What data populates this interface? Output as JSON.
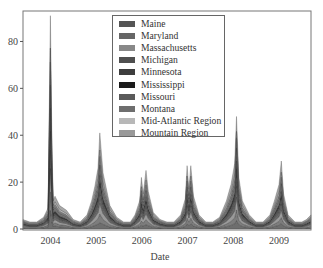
{
  "chart_data": {
    "type": "area",
    "stacked": true,
    "title": "",
    "xlabel": "Date",
    "ylabel": "",
    "xlim": [
      2003.4,
      2009.7
    ],
    "ylim": [
      0,
      93
    ],
    "grid": false,
    "legend_position": "upper center",
    "x_ticks": [
      "2004",
      "2005",
      "2006",
      "2007",
      "2008",
      "2009"
    ],
    "y_ticks": [
      0,
      20,
      40,
      60,
      80
    ],
    "x": [
      2003.4,
      2003.55,
      2003.7,
      2003.85,
      2003.95,
      2004.0,
      2004.03,
      2004.06,
      2004.1,
      2004.2,
      2004.35,
      2004.5,
      2004.65,
      2004.8,
      2004.9,
      2004.97,
      2005.04,
      2005.08,
      2005.15,
      2005.3,
      2005.45,
      2005.6,
      2005.75,
      2005.85,
      2005.95,
      2005.99,
      2006.03,
      2006.09,
      2006.14,
      2006.25,
      2006.4,
      2006.55,
      2006.7,
      2006.85,
      2006.95,
      2006.99,
      2007.03,
      2007.07,
      2007.13,
      2007.25,
      2007.4,
      2007.55,
      2007.7,
      2007.85,
      2007.95,
      2008.03,
      2008.07,
      2008.12,
      2008.2,
      2008.35,
      2008.5,
      2008.65,
      2008.8,
      2008.9,
      2009.0,
      2009.05,
      2009.1,
      2009.2,
      2009.35,
      2009.5,
      2009.6,
      2009.7
    ],
    "series": [
      {
        "name": "Maine",
        "color": "#555555",
        "values": [
          0.4,
          0.3,
          0.3,
          0.5,
          0.9,
          4,
          7,
          3,
          1.4,
          1.0,
          0.8,
          0.4,
          0.3,
          0.5,
          0.9,
          1.4,
          1.8,
          3,
          1.2,
          0.8,
          0.5,
          0.3,
          0.3,
          0.6,
          0.9,
          1.1,
          0.9,
          1.2,
          1.0,
          0.7,
          0.4,
          0.3,
          0.3,
          0.6,
          1.0,
          1.4,
          1.0,
          1.4,
          1.0,
          0.6,
          0.3,
          0.3,
          0.5,
          0.9,
          1.3,
          2,
          4,
          1.6,
          1.0,
          0.6,
          0.3,
          0.3,
          0.6,
          1.0,
          1.3,
          2.2,
          1.1,
          0.6,
          0.3,
          0.3,
          0.4,
          0.5
        ]
      },
      {
        "name": "Maryland",
        "color": "#666666",
        "values": [
          0.4,
          0.3,
          0.3,
          0.5,
          0.9,
          4,
          8,
          3,
          1.4,
          1.0,
          0.8,
          0.4,
          0.3,
          0.6,
          1.0,
          1.5,
          2,
          4,
          1.3,
          0.9,
          0.5,
          0.3,
          0.3,
          0.6,
          1.0,
          1.3,
          1.0,
          1.4,
          1.0,
          0.7,
          0.4,
          0.3,
          0.3,
          0.6,
          1.1,
          1.5,
          1.1,
          1.5,
          1.0,
          0.6,
          0.3,
          0.3,
          0.5,
          1.0,
          1.4,
          2.2,
          5,
          1.8,
          1.0,
          0.6,
          0.3,
          0.3,
          0.6,
          1.0,
          1.4,
          2.4,
          1.2,
          0.6,
          0.3,
          0.3,
          0.4,
          0.5
        ]
      },
      {
        "name": "Massachusetts",
        "color": "#888888",
        "values": [
          0.5,
          0.4,
          0.4,
          0.6,
          1.0,
          5,
          9,
          4,
          1.6,
          1.2,
          0.9,
          0.5,
          0.4,
          0.7,
          1.2,
          1.8,
          2.4,
          5,
          1.6,
          1.0,
          0.6,
          0.4,
          0.4,
          0.7,
          1.2,
          1.6,
          1.2,
          1.7,
          1.2,
          0.8,
          0.5,
          0.4,
          0.4,
          0.7,
          1.3,
          1.8,
          1.3,
          1.8,
          1.2,
          0.7,
          0.4,
          0.4,
          0.6,
          1.2,
          1.7,
          2.6,
          6,
          2.2,
          1.2,
          0.7,
          0.4,
          0.4,
          0.7,
          1.2,
          1.7,
          3,
          1.4,
          0.7,
          0.4,
          0.4,
          0.5,
          0.6
        ]
      },
      {
        "name": "Michigan",
        "color": "#4f4f4f",
        "values": [
          0.4,
          0.3,
          0.3,
          0.5,
          0.9,
          4,
          8,
          3,
          1.4,
          1.0,
          0.8,
          0.4,
          0.3,
          0.6,
          1.0,
          1.5,
          2,
          4,
          1.3,
          0.9,
          0.5,
          0.3,
          0.3,
          0.6,
          1.0,
          1.4,
          1.0,
          1.5,
          1.0,
          0.7,
          0.4,
          0.3,
          0.3,
          0.6,
          1.1,
          1.5,
          1.1,
          1.5,
          1.0,
          0.6,
          0.3,
          0.3,
          0.5,
          1.0,
          1.4,
          2.2,
          5,
          1.8,
          1.0,
          0.6,
          0.3,
          0.3,
          0.6,
          1.0,
          1.4,
          2.4,
          1.2,
          0.6,
          0.3,
          0.3,
          0.4,
          0.5
        ]
      },
      {
        "name": "Minnesota",
        "color": "#3d3d3d",
        "values": [
          0.3,
          0.2,
          0.2,
          0.4,
          0.8,
          4,
          8,
          3,
          1.2,
          0.9,
          0.7,
          0.3,
          0.2,
          0.5,
          0.9,
          1.4,
          1.9,
          4,
          1.2,
          0.8,
          0.4,
          0.2,
          0.2,
          0.5,
          0.9,
          1.3,
          0.9,
          1.4,
          0.9,
          0.6,
          0.3,
          0.2,
          0.2,
          0.5,
          1.0,
          1.4,
          1.0,
          1.4,
          0.9,
          0.5,
          0.2,
          0.2,
          0.4,
          0.9,
          1.3,
          2.1,
          5,
          1.7,
          0.9,
          0.5,
          0.2,
          0.2,
          0.5,
          0.9,
          1.3,
          2.3,
          1.1,
          0.5,
          0.2,
          0.2,
          0.3,
          0.4
        ]
      },
      {
        "name": "Mississippi",
        "color": "#1a1a1a",
        "values": [
          0.4,
          0.3,
          0.3,
          0.5,
          1.0,
          5,
          10,
          4,
          1.5,
          1.1,
          0.8,
          0.4,
          0.3,
          0.6,
          1.1,
          1.7,
          2.4,
          5,
          1.5,
          1.0,
          0.5,
          0.3,
          0.3,
          0.6,
          1.1,
          1.6,
          1.1,
          1.6,
          1.1,
          0.7,
          0.4,
          0.3,
          0.3,
          0.6,
          1.2,
          1.7,
          1.2,
          1.7,
          1.1,
          0.6,
          0.3,
          0.3,
          0.5,
          1.1,
          1.6,
          2.5,
          7,
          2.0,
          1.1,
          0.6,
          0.3,
          0.3,
          0.6,
          1.1,
          1.6,
          2.8,
          1.3,
          0.6,
          0.3,
          0.3,
          0.4,
          0.5
        ]
      },
      {
        "name": "Missouri",
        "color": "#5a5a5a",
        "values": [
          0.5,
          0.4,
          0.4,
          0.6,
          1.1,
          5,
          10,
          4,
          1.7,
          1.3,
          1.0,
          0.5,
          0.4,
          0.7,
          1.3,
          2.0,
          2.8,
          5,
          1.8,
          1.1,
          0.6,
          0.4,
          0.4,
          0.7,
          1.3,
          1.9,
          1.3,
          1.9,
          1.3,
          0.8,
          0.5,
          0.4,
          0.4,
          0.7,
          1.4,
          2.0,
          1.4,
          2.0,
          1.3,
          0.7,
          0.4,
          0.4,
          0.6,
          1.3,
          1.9,
          2.9,
          6,
          2.3,
          1.3,
          0.7,
          0.4,
          0.4,
          0.7,
          1.3,
          1.9,
          3.2,
          1.5,
          0.7,
          0.4,
          0.4,
          0.5,
          0.6
        ]
      },
      {
        "name": "Montana",
        "color": "#6e6e6e",
        "values": [
          0.4,
          0.3,
          0.3,
          0.5,
          0.9,
          5,
          9,
          3,
          1.4,
          1.0,
          0.8,
          0.4,
          0.3,
          0.6,
          1.1,
          1.6,
          2.2,
          4,
          1.4,
          0.9,
          0.5,
          0.3,
          0.3,
          0.6,
          1.1,
          1.5,
          1.1,
          1.6,
          1.1,
          0.7,
          0.4,
          0.3,
          0.3,
          0.6,
          1.2,
          1.6,
          1.2,
          1.6,
          1.1,
          0.6,
          0.3,
          0.3,
          0.5,
          1.1,
          1.5,
          2.3,
          5,
          1.9,
          1.1,
          0.6,
          0.3,
          0.3,
          0.6,
          1.1,
          1.5,
          2.6,
          1.2,
          0.6,
          0.3,
          0.3,
          0.4,
          0.5
        ]
      },
      {
        "name": "Mid-Atlantic Region",
        "color": "#b8b8b8",
        "values": [
          0.3,
          0.3,
          0.3,
          0.4,
          0.8,
          3,
          6,
          2.5,
          1.2,
          0.9,
          0.7,
          0.3,
          0.3,
          0.5,
          0.9,
          1.3,
          1.8,
          3,
          1.1,
          0.8,
          0.4,
          0.3,
          0.3,
          0.5,
          0.9,
          1.2,
          0.9,
          1.3,
          0.9,
          0.6,
          0.3,
          0.3,
          0.3,
          0.5,
          1.0,
          1.3,
          1.0,
          1.3,
          0.9,
          0.5,
          0.3,
          0.3,
          0.4,
          0.9,
          1.2,
          1.9,
          3,
          1.5,
          0.9,
          0.5,
          0.3,
          0.3,
          0.5,
          0.9,
          1.2,
          2.0,
          1.0,
          0.5,
          0.3,
          0.3,
          0.3,
          0.4
        ]
      },
      {
        "name": "Mountain Region",
        "color": "#999999",
        "values": [
          0.6,
          0.5,
          0.5,
          0.8,
          1.5,
          7,
          16,
          6,
          2.6,
          1.8,
          1.4,
          0.7,
          0.5,
          1.0,
          1.8,
          2.7,
          3.6,
          8,
          2.4,
          1.5,
          0.8,
          0.5,
          0.5,
          1.0,
          1.8,
          2.8,
          1.9,
          2.7,
          1.9,
          1.1,
          0.6,
          0.5,
          0.5,
          1.0,
          2.0,
          2.8,
          2.0,
          2.8,
          1.9,
          1.0,
          0.5,
          0.5,
          0.8,
          1.8,
          2.6,
          4.0,
          7,
          3.2,
          1.8,
          1.0,
          0.5,
          0.5,
          1.0,
          1.8,
          2.6,
          4.5,
          2.1,
          1.0,
          0.5,
          0.5,
          0.6,
          0.8
        ]
      }
    ],
    "envelope_peaks": [
      {
        "x": 2003.95,
        "total": 91
      },
      {
        "x": 2005.04,
        "total": 41
      },
      {
        "x": 2005.99,
        "total": 22
      },
      {
        "x": 2006.14,
        "total": 25
      },
      {
        "x": 2006.99,
        "total": 27
      },
      {
        "x": 2007.13,
        "total": 27
      },
      {
        "x": 2008.07,
        "total": 48
      },
      {
        "x": 2009.1,
        "total": 29
      }
    ],
    "envelope": [
      4,
      3,
      3,
      5,
      9,
      91,
      40,
      12,
      14,
      10,
      8,
      4,
      3,
      6,
      12,
      18,
      26,
      41,
      24,
      10,
      5,
      3,
      3,
      6,
      12,
      22,
      15,
      25,
      16,
      7,
      4,
      3,
      3,
      6,
      13,
      27,
      17,
      27,
      14,
      6,
      3,
      3,
      5,
      12,
      19,
      28,
      48,
      22,
      12,
      6,
      3,
      3,
      6,
      12,
      19,
      29,
      15,
      6,
      3,
      3,
      4,
      6
    ]
  },
  "legend": {
    "items": [
      {
        "label": "Maine",
        "color": "#555555"
      },
      {
        "label": "Maryland",
        "color": "#666666"
      },
      {
        "label": "Massachusetts",
        "color": "#888888"
      },
      {
        "label": "Michigan",
        "color": "#4f4f4f"
      },
      {
        "label": "Minnesota",
        "color": "#3d3d3d"
      },
      {
        "label": "Mississippi",
        "color": "#1a1a1a"
      },
      {
        "label": "Missouri",
        "color": "#5a5a5a"
      },
      {
        "label": "Montana",
        "color": "#6e6e6e"
      },
      {
        "label": "Mid-Atlantic Region",
        "color": "#b8b8b8"
      },
      {
        "label": "Mountain Region",
        "color": "#999999"
      }
    ]
  },
  "axes": {
    "xlabel": "Date",
    "x_ticks": [
      "2004",
      "2005",
      "2006",
      "2007",
      "2008",
      "2009"
    ],
    "y_ticks": [
      "0",
      "20",
      "40",
      "60",
      "80"
    ]
  }
}
